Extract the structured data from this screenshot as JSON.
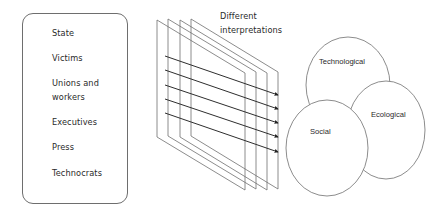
{
  "stakeholders": {
    "items": [
      {
        "label": "State"
      },
      {
        "label": "Victims"
      },
      {
        "label": "Unions and"
      },
      {
        "label": "workers"
      },
      {
        "label": "Executives"
      },
      {
        "label": "Press"
      },
      {
        "label": "Technocrats"
      }
    ]
  },
  "planes": {
    "caption_line1": "Different",
    "caption_line2": "interpretations",
    "count": 4,
    "arrow_count": 5
  },
  "dimensions": {
    "technological": "Technological",
    "ecological": "Ecological",
    "social": "Social"
  },
  "colors": {
    "line": "#6e6e6e",
    "arrow": "#333333",
    "text": "#2a2a2a"
  }
}
